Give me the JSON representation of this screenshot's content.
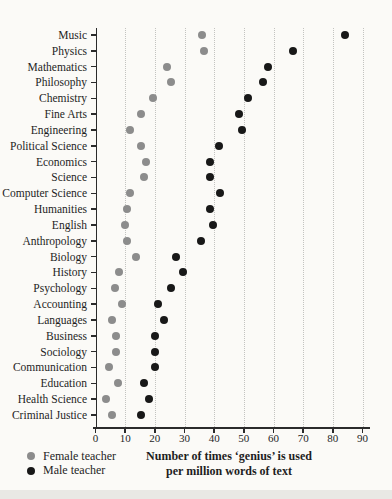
{
  "chart_data": {
    "type": "scatter",
    "subtype": "horizontal-dot-plot",
    "title": "",
    "xlabel_line1": "Number of times ‘genius’ is used",
    "xlabel_line2": "per million words of text",
    "xlim": [
      0,
      90
    ],
    "xticks": [
      0,
      10,
      20,
      30,
      40,
      50,
      60,
      70,
      80,
      90
    ],
    "grid": "vertical-dotted",
    "legend_position": "bottom-left",
    "categories": [
      "Music",
      "Physics",
      "Mathematics",
      "Philosophy",
      "Chemistry",
      "Fine Arts",
      "Engineering",
      "Political Science",
      "Economics",
      "Science",
      "Computer Science",
      "Humanities",
      "English",
      "Anthropology",
      "Biology",
      "History",
      "Psychology",
      "Accounting",
      "Languages",
      "Business",
      "Sociology",
      "Communication",
      "Education",
      "Health Science",
      "Criminal Justice"
    ],
    "series": [
      {
        "name": "Female teacher",
        "color": "#8c8c8c",
        "values": [
          36,
          36.5,
          24,
          25.5,
          19.5,
          15.5,
          11.5,
          15.5,
          17,
          16.5,
          11.5,
          10.5,
          10,
          10.5,
          13.5,
          8,
          6.5,
          9,
          5.5,
          7,
          7,
          4.5,
          7.5,
          3.5,
          5.5
        ]
      },
      {
        "name": "Male teacher",
        "color": "#181818",
        "values": [
          84,
          66.5,
          58,
          56.5,
          51.5,
          48.5,
          49.5,
          41.5,
          38.5,
          38.5,
          42,
          38.5,
          39.5,
          35.5,
          27,
          29.5,
          25.5,
          21,
          23,
          20,
          20,
          20,
          16.5,
          18,
          15.5
        ]
      }
    ]
  },
  "legend": {
    "items": [
      {
        "label": "Female teacher",
        "color": "#8c8c8c",
        "icon": "gray-dot-icon"
      },
      {
        "label": "Male teacher",
        "color": "#181818",
        "icon": "black-dot-icon"
      }
    ]
  }
}
